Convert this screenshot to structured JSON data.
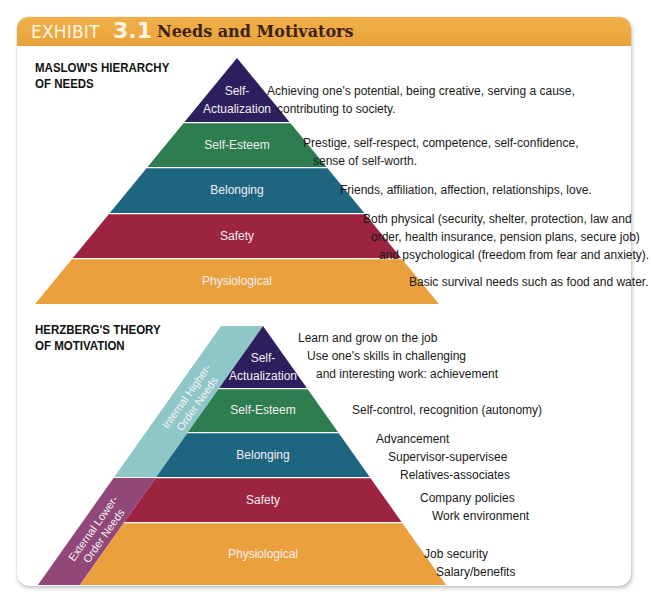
{
  "header": {
    "exhibit_word": "EXHIBIT",
    "exhibit_number": "3.1",
    "title": "Needs and Motivators"
  },
  "colors": {
    "header": "#eea63f",
    "self_actualization": "#2d1f5e",
    "self_esteem": "#2e7d4f",
    "belonging": "#1e6680",
    "safety": "#9c2440",
    "physiological": "#eaa03c",
    "internal_higher": "#8fc6c8",
    "external_lower": "#92477a"
  },
  "maslow": {
    "title_line1": "MASLOW'S HIERARCHY",
    "title_line2": "OF NEEDS",
    "levels": [
      {
        "key": "self_actualization",
        "label_lines": [
          "Self-",
          "Actualization"
        ],
        "desc_lines": [
          "Achieving one's potential, being creative, serving a cause,",
          "contributing to society."
        ]
      },
      {
        "key": "self_esteem",
        "label_lines": [
          "Self-Esteem"
        ],
        "desc_lines": [
          "Prestige, self-respect, competence, self-confidence,",
          "sense of self-worth."
        ]
      },
      {
        "key": "belonging",
        "label_lines": [
          "Belonging"
        ],
        "desc_lines": [
          "Friends, affiliation, affection, relationships, love."
        ]
      },
      {
        "key": "safety",
        "label_lines": [
          "Safety"
        ],
        "desc_lines": [
          "Both physical (security, shelter, protection, law and",
          "order, health insurance, pension plans, secure job)",
          "and psychological (freedom from fear and anxiety)."
        ]
      },
      {
        "key": "physiological",
        "label_lines": [
          "Physiological"
        ],
        "desc_lines": [
          "Basic survival needs such as food and water."
        ]
      }
    ]
  },
  "herzberg": {
    "title_line1": "HERZBERG'S THEORY",
    "title_line2": "OF MOTIVATION",
    "internal_label_lines": [
      "Internal Higher-",
      "Order Needs"
    ],
    "external_label_lines": [
      "External Lower-",
      "Order Needs"
    ],
    "levels": [
      {
        "key": "self_actualization",
        "label_lines": [
          "Self-",
          "Actualization"
        ],
        "desc_lines": [
          "Learn and grow on the job",
          "Use one's skills in challenging",
          "and interesting work: achievement"
        ]
      },
      {
        "key": "self_esteem",
        "label_lines": [
          "Self-Esteem"
        ],
        "desc_lines": [
          "Self-control, recognition  (autonomy)"
        ]
      },
      {
        "key": "belonging",
        "label_lines": [
          "Belonging"
        ],
        "desc_lines": [
          "Advancement",
          "Supervisor-supervisee",
          "Relatives-associates"
        ]
      },
      {
        "key": "safety",
        "label_lines": [
          "Safety"
        ],
        "desc_lines": [
          "Company policies",
          "Work environment"
        ]
      },
      {
        "key": "physiological",
        "label_lines": [
          "Physiological"
        ],
        "desc_lines": [
          "Job security",
          "Salary/benefits"
        ]
      }
    ]
  }
}
